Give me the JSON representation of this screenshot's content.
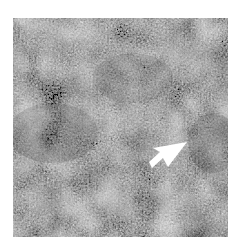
{
  "image": {
    "kind": "grayscale textured micrograph",
    "colors": {
      "base": "#7a7a7a",
      "dark": "#4a4a4a",
      "light": "#b8b8b8",
      "arrow": "#ffffff",
      "background": "#ffffff"
    },
    "annotation": {
      "type": "arrow",
      "direction": "up-right",
      "icon": "arrow-icon"
    }
  }
}
